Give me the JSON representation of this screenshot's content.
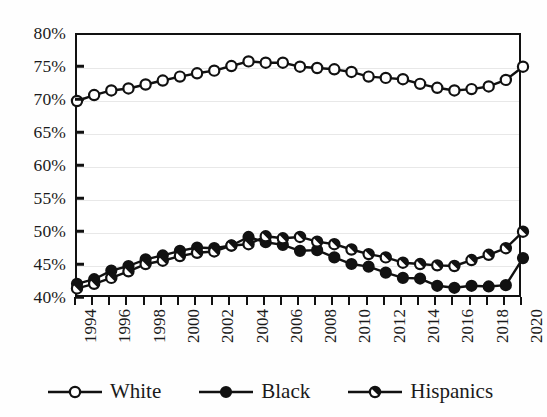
{
  "chart_data": {
    "type": "line",
    "title": "",
    "subtitle": "",
    "xlabel": "",
    "ylabel": "",
    "xlim": [
      1994,
      2020
    ],
    "ylim": [
      40,
      80
    ],
    "ytick_step": 5,
    "xtick_step": 1,
    "xlabel_step": 2,
    "grid": true,
    "legend_position": "bottom",
    "yticklabels": [
      "80%",
      "75%",
      "70%",
      "65%",
      "60%",
      "55%",
      "50%",
      "45%",
      "40%"
    ],
    "ytickvalues": [
      80,
      75,
      70,
      65,
      60,
      55,
      50,
      45,
      40
    ],
    "x": [
      1994,
      1995,
      1996,
      1997,
      1998,
      1999,
      2000,
      2001,
      2002,
      2003,
      2004,
      2005,
      2006,
      2007,
      2008,
      2009,
      2010,
      2011,
      2012,
      2013,
      2014,
      2015,
      2016,
      2017,
      2018,
      2019,
      2020
    ],
    "xticklabels": [
      "1994",
      "1996",
      "1998",
      "2000",
      "2002",
      "2004",
      "2006",
      "2008",
      "2010",
      "2012",
      "2014",
      "2016",
      "2018",
      "2020"
    ],
    "xtickvalues": [
      1994,
      1996,
      1998,
      2000,
      2002,
      2004,
      2006,
      2008,
      2010,
      2012,
      2014,
      2016,
      2018,
      2020
    ],
    "series": [
      {
        "name": "White",
        "marker": "open-circle",
        "color": "#111111",
        "values": [
          70.0,
          70.9,
          71.6,
          71.9,
          72.5,
          73.1,
          73.7,
          74.2,
          74.6,
          75.3,
          76.0,
          75.8,
          75.8,
          75.2,
          75.0,
          74.8,
          74.4,
          73.7,
          73.5,
          73.3,
          72.6,
          72.0,
          71.6,
          71.8,
          72.2,
          73.2,
          75.2
        ]
      },
      {
        "name": "Black",
        "marker": "filled-circle",
        "color": "#111111",
        "values": [
          42.3,
          43.0,
          44.3,
          45.0,
          46.0,
          46.6,
          47.3,
          47.8,
          47.7,
          48.1,
          49.4,
          48.6,
          48.2,
          47.3,
          47.4,
          46.3,
          45.3,
          44.9,
          44.0,
          43.2,
          43.1,
          42.0,
          41.7,
          42.0,
          41.9,
          42.1,
          46.2
        ]
      },
      {
        "name": "Hispanics",
        "marker": "half-circle",
        "color": "#111111",
        "values": [
          41.6,
          42.3,
          43.2,
          44.2,
          45.3,
          45.8,
          46.5,
          47.0,
          47.2,
          48.1,
          48.3,
          49.5,
          49.2,
          49.4,
          48.7,
          48.3,
          47.5,
          46.8,
          46.3,
          45.5,
          45.3,
          45.1,
          45.0,
          45.9,
          46.7,
          47.7,
          50.2
        ]
      }
    ],
    "legend": [
      {
        "label": "White",
        "marker": "open-circle"
      },
      {
        "label": "Black",
        "marker": "filled-circle"
      },
      {
        "label": "Hispanics",
        "marker": "half-circle"
      }
    ]
  }
}
